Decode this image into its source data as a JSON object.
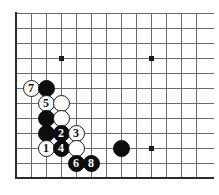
{
  "figure": {
    "kind": "go-board-diagram",
    "board_size": 19,
    "visible_region": {
      "cols": 13,
      "rows": 12,
      "note": "lower-left corner of the board"
    },
    "geometry": {
      "origin_x": 16,
      "origin_y": 13,
      "spacing": 15,
      "cols": 13,
      "rows": 12,
      "stone_diameter": 17,
      "border_px": 2
    },
    "colors": {
      "background": "#ffffff",
      "grid_line": "#6b6b6b",
      "border_line": "#2b2b2b",
      "black_stone": "#0d0d0d",
      "white_stone": "#ffffff",
      "white_stone_border": "#1a1a1a",
      "black_label": "#ffffff",
      "white_label": "#111111",
      "star_point": "#1a1a1a"
    },
    "star_points": [
      {
        "col": 3,
        "row": 3
      },
      {
        "col": 9,
        "row": 3
      },
      {
        "col": 9,
        "row": 9
      }
    ],
    "edges": {
      "left": true,
      "bottom": true,
      "top": false,
      "right": false
    },
    "stones": [
      {
        "id": "s-w7",
        "color": "white",
        "label": "7",
        "col": 1,
        "row": 5
      },
      {
        "id": "s-b-a",
        "color": "black",
        "label": "",
        "col": 2,
        "row": 5
      },
      {
        "id": "s-w5",
        "color": "white",
        "label": "5",
        "col": 2,
        "row": 6
      },
      {
        "id": "s-w-b",
        "color": "white",
        "label": "",
        "col": 3,
        "row": 6
      },
      {
        "id": "s-b-c",
        "color": "black",
        "label": "",
        "col": 2,
        "row": 7
      },
      {
        "id": "s-w-d",
        "color": "white",
        "label": "",
        "col": 3,
        "row": 7
      },
      {
        "id": "s-b-e",
        "color": "black",
        "label": "",
        "col": 2,
        "row": 8
      },
      {
        "id": "s-b2",
        "color": "black",
        "label": "2",
        "col": 3,
        "row": 8
      },
      {
        "id": "s-w3",
        "color": "white",
        "label": "3",
        "col": 4,
        "row": 8
      },
      {
        "id": "s-w1",
        "color": "white",
        "label": "1",
        "col": 2,
        "row": 9
      },
      {
        "id": "s-b4",
        "color": "black",
        "label": "4",
        "col": 3,
        "row": 9
      },
      {
        "id": "s-w-f",
        "color": "white",
        "label": "",
        "col": 4,
        "row": 9
      },
      {
        "id": "s-b6",
        "color": "black",
        "label": "6",
        "col": 4,
        "row": 10
      },
      {
        "id": "s-b8",
        "color": "black",
        "label": "8",
        "col": 5,
        "row": 10
      },
      {
        "id": "s-b-g",
        "color": "black",
        "label": "",
        "col": 7,
        "row": 9
      }
    ],
    "move_sequence": [
      {
        "move": 1,
        "color": "white"
      },
      {
        "move": 2,
        "color": "black"
      },
      {
        "move": 3,
        "color": "white"
      },
      {
        "move": 4,
        "color": "black"
      },
      {
        "move": 5,
        "color": "white"
      },
      {
        "move": 6,
        "color": "black"
      },
      {
        "move": 7,
        "color": "white"
      },
      {
        "move": 8,
        "color": "black"
      }
    ]
  }
}
